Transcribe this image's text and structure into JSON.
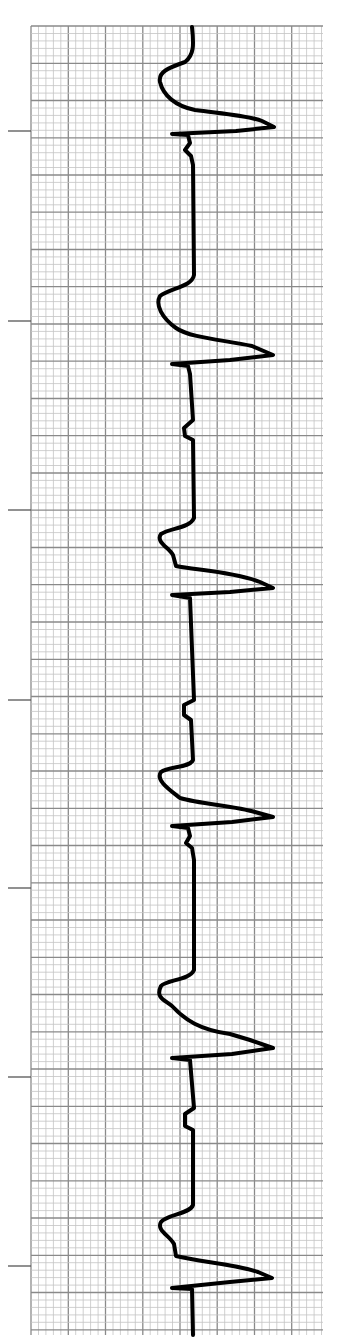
{
  "chart_data": {
    "type": "line",
    "title": "",
    "xlabel": "",
    "ylabel": "",
    "grid": {
      "on": true,
      "left": 31,
      "top": 26,
      "right": 323,
      "bottom": 1335,
      "minor_spacing": 7.45,
      "major_every": 5,
      "minor_color": "#c4c4c4",
      "major_color": "#8a8a8a"
    },
    "tick_marks_y": [
      131,
      321,
      510,
      700,
      888,
      1077,
      1266
    ],
    "tick_x_range": [
      8,
      31
    ],
    "trace_color": "#000000",
    "baseline_x": 193,
    "beats": [
      {
        "index": 1,
        "t_wave_y": 75,
        "r_peak": {
          "x": 274,
          "y": 127
        },
        "s_return_y": 134,
        "p_wave_y": 150
      },
      {
        "index": 2,
        "t_wave_y": 298,
        "r_peak": {
          "x": 273,
          "y": 355
        },
        "s_return_y": 364,
        "p_wave_y": 430
      },
      {
        "index": 3,
        "t_wave_y": 537,
        "r_peak": {
          "x": 273,
          "y": 588
        },
        "s_return_y": 595,
        "p_wave_y": 707
      },
      {
        "index": 4,
        "t_wave_y": 770,
        "r_peak": {
          "x": 273,
          "y": 817
        },
        "s_return_y": 826,
        "p_wave_y": 845
      },
      {
        "index": 5,
        "t_wave_y": 1000,
        "r_peak": {
          "x": 273,
          "y": 1048
        },
        "s_return_y": 1058,
        "p_wave_y": 1120
      },
      {
        "index": 6,
        "t_wave_y": 1228,
        "r_peak": {
          "x": 272,
          "y": 1278
        },
        "s_return_y": 1288,
        "p_wave_y": null
      }
    ]
  }
}
